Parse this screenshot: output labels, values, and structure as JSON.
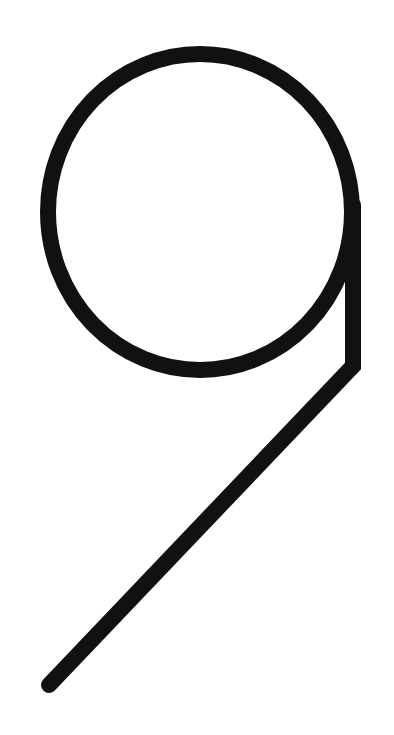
{
  "glyph": {
    "character": "9",
    "stroke_color": "#111111",
    "background_color": "#ffffff",
    "stroke_width": 16,
    "circle": {
      "cx": 200,
      "cy": 212,
      "rx": 152,
      "ry": 158
    },
    "stem": {
      "x": 353,
      "y_top": 205,
      "y_bottom": 366
    },
    "tail": {
      "x1": 353,
      "y1": 366,
      "x2": 49,
      "y2": 685
    }
  }
}
